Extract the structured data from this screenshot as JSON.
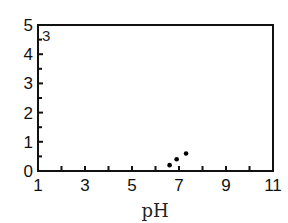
{
  "chart_data": {
    "type": "scatter",
    "title": "",
    "panel_label": "3",
    "xlabel": "pH",
    "ylabel": "",
    "xlim": [
      1,
      11
    ],
    "ylim": [
      0,
      5
    ],
    "x_ticks": [
      1,
      3,
      5,
      7,
      9,
      11
    ],
    "x_minor_ticks": [
      2,
      4,
      6,
      8,
      10
    ],
    "y_ticks": [
      0,
      1,
      2,
      3,
      4,
      5
    ],
    "y_minor_step": 0.5,
    "grid": false,
    "legend": null,
    "series": [
      {
        "name": "data",
        "x": [
          6.6,
          6.9,
          7.3
        ],
        "y": [
          0.2,
          0.4,
          0.6
        ]
      }
    ]
  },
  "colors": {
    "axis": "#111111",
    "point": "#000000",
    "background": "#ffffff"
  }
}
